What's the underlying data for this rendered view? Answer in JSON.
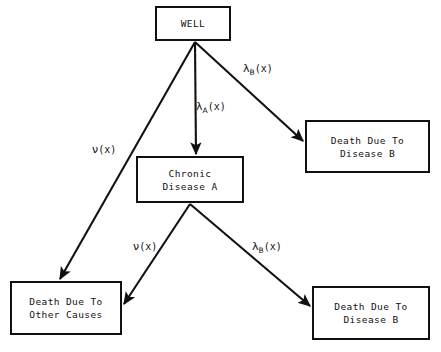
{
  "diagram": {
    "background_color": "#ffffff",
    "stroke_color": "#111111",
    "nodes": [
      {
        "id": "well",
        "name": "well",
        "lines": [
          "WELL"
        ],
        "x": 155,
        "y": 6,
        "width": 76,
        "height": 35
      },
      {
        "id": "chronic-disease-a",
        "name": "chronic-disease-a",
        "lines": [
          "Chronic",
          "Disease A"
        ],
        "x": 136,
        "y": 156,
        "width": 108,
        "height": 47
      },
      {
        "id": "death-disease-b-top",
        "name": "death-due-to-disease-b-top",
        "lines": [
          "Death Due To",
          "Disease B"
        ],
        "x": 305,
        "y": 120,
        "width": 125,
        "height": 53
      },
      {
        "id": "death-other-causes",
        "name": "death-due-to-other-causes",
        "lines": [
          "Death Due To",
          "Other Causes"
        ],
        "x": 10,
        "y": 281,
        "width": 112,
        "height": 54
      },
      {
        "id": "death-disease-b-bottom",
        "name": "death-due-to-disease-b-bottom",
        "lines": [
          "Death Due To",
          "Disease B"
        ],
        "x": 312,
        "y": 286,
        "width": 118,
        "height": 54
      }
    ],
    "edges": [
      {
        "id": "well-to-other-causes",
        "name": "edge-well-to-other-causes",
        "from": "well",
        "to": "death-other-causes",
        "label_symbol": "ν",
        "label_subscript": "",
        "label_arg": "(x)",
        "label_full": "ν(x)",
        "label_x": 92,
        "label_y": 144,
        "x1": 195,
        "y1": 42,
        "x2": 60,
        "y2": 279
      },
      {
        "id": "well-to-chronic-a",
        "name": "edge-well-to-chronic-disease-a",
        "from": "well",
        "to": "chronic-disease-a",
        "label_symbol": "λ",
        "label_subscript": "A",
        "label_arg": "(x)",
        "label_full": "λA(x)",
        "label_x": 196,
        "label_y": 101,
        "x1": 195,
        "y1": 42,
        "x2": 196,
        "y2": 154
      },
      {
        "id": "well-to-disease-b-top",
        "name": "edge-well-to-death-disease-b-top",
        "from": "well",
        "to": "death-disease-b-top",
        "label_symbol": "λ",
        "label_subscript": "B",
        "label_arg": "(x)",
        "label_full": "λB(x)",
        "label_x": 243,
        "label_y": 63,
        "x1": 195,
        "y1": 42,
        "x2": 303,
        "y2": 141
      },
      {
        "id": "chronic-a-to-other-causes",
        "name": "edge-chronic-disease-a-to-other-causes",
        "from": "chronic-disease-a",
        "to": "death-other-causes",
        "label_symbol": "ν",
        "label_subscript": "",
        "label_arg": "(x)",
        "label_full": "ν(x)",
        "label_x": 133,
        "label_y": 241,
        "x1": 190,
        "y1": 204,
        "x2": 124,
        "y2": 304
      },
      {
        "id": "chronic-a-to-disease-b-bottom",
        "name": "edge-chronic-disease-a-to-death-disease-b-bottom",
        "from": "chronic-disease-a",
        "to": "death-disease-b-bottom",
        "label_symbol": "λ",
        "label_subscript": "B",
        "label_arg": "(x)",
        "label_full": "λB(x)",
        "label_x": 252,
        "label_y": 241,
        "x1": 190,
        "y1": 204,
        "x2": 310,
        "y2": 306
      }
    ]
  }
}
